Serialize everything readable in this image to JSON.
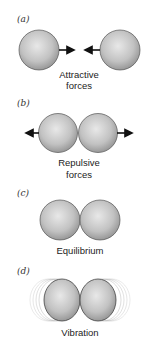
{
  "panels": [
    {
      "label": "(a)",
      "caption_line1": "Attractive",
      "caption_line2": "forces"
    },
    {
      "label": "(b)",
      "caption_line1": "Repulsive",
      "caption_line2": "forces"
    },
    {
      "label": "(c)",
      "caption_line1": "Equilibrium"
    },
    {
      "label": "(d)",
      "caption_line1": "Vibration"
    }
  ],
  "colors": {
    "sphere_light": "#e4e4e4",
    "sphere_dark": "#9a9a9a",
    "outline": "#555555",
    "arrow": "#111111"
  }
}
